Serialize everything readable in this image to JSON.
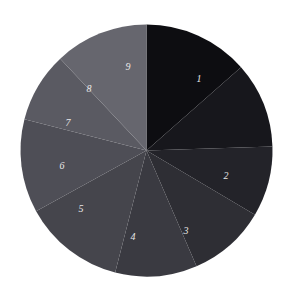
{
  "chart_data": {
    "type": "pie",
    "title": "",
    "subtitle": "",
    "xlabel": "",
    "ylabel": "",
    "legend_position": "none",
    "grid": false,
    "start_angle_deg": 90,
    "direction": "clockwise",
    "center": {
      "x": 146.5,
      "y": 150.5
    },
    "radius": 126,
    "background_color": "#ffffff",
    "label_color": "#e8e8e8",
    "categories": [
      "1",
      "2",
      "3",
      "4",
      "5",
      "6",
      "7",
      "8",
      "9"
    ],
    "values": [
      13.5,
      11.0,
      9.0,
      10.0,
      10.5,
      13.0,
      12.0,
      9.0,
      12.0
    ],
    "slices": [
      {
        "label": "1",
        "value": 13.5,
        "color": "#0d0d11",
        "start_deg": 0.0,
        "end_deg": 48.6,
        "label_x": 199,
        "label_y": 80
      },
      {
        "label": "2",
        "value": 11.0,
        "color": "#17171c",
        "start_deg": 48.6,
        "end_deg": 88.2,
        "label_x": 226,
        "label_y": 177
      },
      {
        "label": "3",
        "value": 9.0,
        "color": "#232329",
        "start_deg": 88.2,
        "end_deg": 120.6,
        "label_x": 186,
        "label_y": 232
      },
      {
        "label": "4",
        "value": 10.0,
        "color": "#2e2e34",
        "start_deg": 120.6,
        "end_deg": 156.6,
        "label_x": 133,
        "label_y": 238
      },
      {
        "label": "5",
        "value": 10.5,
        "color": "#3a3a41",
        "start_deg": 156.6,
        "end_deg": 194.4,
        "label_x": 81,
        "label_y": 210
      },
      {
        "label": "6",
        "value": 13.0,
        "color": "#45454c",
        "start_deg": 194.4,
        "end_deg": 241.2,
        "label_x": 62,
        "label_y": 167
      },
      {
        "label": "7",
        "value": 12.0,
        "color": "#4e4e56",
        "start_deg": 241.2,
        "end_deg": 284.4,
        "label_x": 68,
        "label_y": 124
      },
      {
        "label": "8",
        "value": 9.0,
        "color": "#5a5a62",
        "start_deg": 284.4,
        "end_deg": 316.8,
        "label_x": 89,
        "label_y": 90
      },
      {
        "label": "9",
        "value": 12.0,
        "color": "#66666e",
        "start_deg": 316.8,
        "end_deg": 360.0,
        "label_x": 128,
        "label_y": 68
      }
    ]
  }
}
